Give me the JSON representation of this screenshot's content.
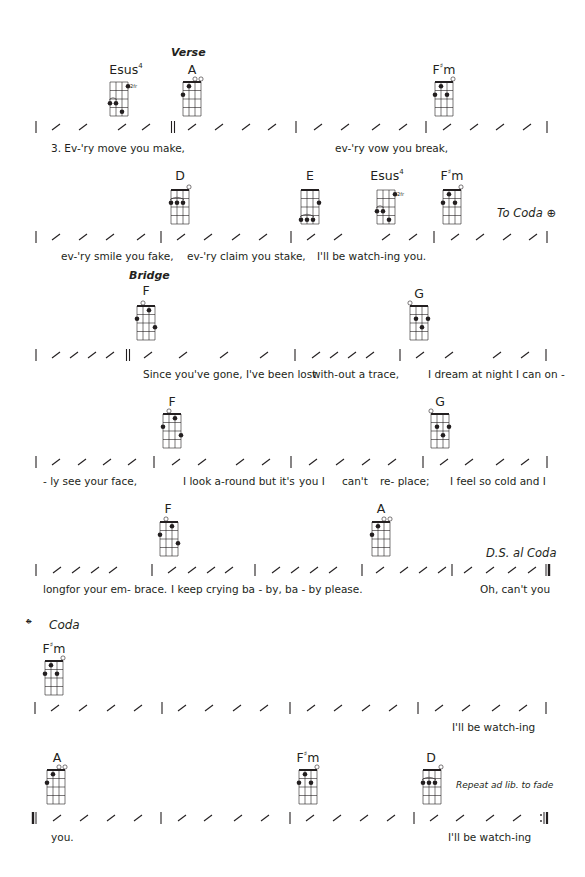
{
  "colors": {
    "ink": "#231f20",
    "paper": "#ffffff"
  },
  "sections": {
    "verse": "Verse",
    "bridge": "Bridge",
    "coda": "Coda"
  },
  "directions": {
    "to_coda": "To Coda",
    "ds_al_coda": "D.S. al Coda",
    "repeat": "Repeat ad lib. to fade"
  },
  "icons": {
    "coda_symbol": "coda-icon",
    "fret_marker": "2fr"
  },
  "chords": {
    "r1_esus4": {
      "root": "Esus",
      "sup": "4"
    },
    "r1_a": {
      "root": "A"
    },
    "r1_fsm": {
      "root": "F",
      "acc": "♯",
      "suffix": "m"
    },
    "r2_d": {
      "root": "D"
    },
    "r2_e": {
      "root": "E"
    },
    "r2_esus4": {
      "root": "Esus",
      "sup": "4"
    },
    "r2_fsm": {
      "root": "F",
      "acc": "♯",
      "suffix": "m"
    },
    "r3_f": {
      "root": "F"
    },
    "r3_g": {
      "root": "G"
    },
    "r4_f": {
      "root": "F"
    },
    "r4_g": {
      "root": "G"
    },
    "r5_f": {
      "root": "F"
    },
    "r5_a": {
      "root": "A"
    },
    "r6_fsm": {
      "root": "F",
      "acc": "♯",
      "suffix": "m"
    },
    "r7_a": {
      "root": "A"
    },
    "r7_fsm": {
      "root": "F",
      "acc": "♯",
      "suffix": "m"
    },
    "r7_d": {
      "root": "D"
    }
  },
  "lyrics": {
    "r1": [
      {
        "x": 51,
        "text": "3. Ev-'ry move  you    make,"
      },
      {
        "x": 335,
        "text": "ev-'ry vow    you    break,"
      }
    ],
    "r2": [
      {
        "x": 61,
        "text": "ev-'ry smile you  fake,"
      },
      {
        "x": 187,
        "text": "ev-'ry claim you stake,"
      },
      {
        "x": 317,
        "text": "I'll be watch-ing  you."
      }
    ],
    "r3": [
      {
        "x": 143,
        "text": "Since you've gone, I've been lost"
      },
      {
        "x": 312,
        "text": "with-out   a trace,"
      },
      {
        "x": 428,
        "text": "I dream at night  I can on -"
      }
    ],
    "r4": [
      {
        "x": 43,
        "text": "-     ly     see your  face,"
      },
      {
        "x": 183,
        "text": "I look a-round but it's"
      },
      {
        "x": 299,
        "text": "you I"
      },
      {
        "x": 342,
        "text": "can't"
      },
      {
        "x": 380,
        "text": "re- place;"
      },
      {
        "x": 450,
        "text": "I feel so cold   and I"
      }
    ],
    "r5": [
      {
        "x": 43,
        "text": "longfor your em- brace."
      },
      {
        "x": 171,
        "text": "I keep crying  ba    -    by,  ba - by  please."
      },
      {
        "x": 480,
        "text": "Oh, can't you"
      }
    ],
    "r6": [
      {
        "x": 452,
        "text": "I'll be watch-ing"
      }
    ],
    "r7": [
      {
        "x": 51,
        "text": "you."
      },
      {
        "x": 448,
        "text": "I'll be watch-ing"
      }
    ]
  }
}
